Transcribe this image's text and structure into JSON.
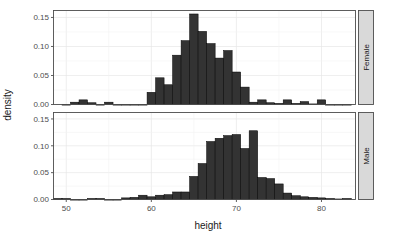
{
  "chart_data": {
    "type": "bar",
    "title": "",
    "subtitle": "",
    "xlabel": "height",
    "ylabel": "density",
    "xlim": [
      48.5,
      84.0
    ],
    "ylim": [
      0.0,
      0.162
    ],
    "grid": true,
    "legend_position": "none",
    "facet_layout": "vertical",
    "facet_strip_position": "right",
    "x_ticks": [
      50,
      60,
      70,
      80
    ],
    "x_tick_labels": [
      "50",
      "60",
      "70",
      "80"
    ],
    "y_ticks": [
      0.0,
      0.05,
      0.1,
      0.15
    ],
    "y_tick_labels": [
      "0.00",
      "0.05",
      "0.10",
      "0.15"
    ],
    "bin_width": 1.0,
    "bar_fill": "#333333",
    "bar_stroke": "#000000",
    "panel_background": "#ffffff",
    "grid_color": "#e6e6e6",
    "strip_background": "#d9d9d9",
    "panels": [
      {
        "label": "Female",
        "bins": [
          {
            "x": 50.0,
            "density": 0.0
          },
          {
            "x": 51.0,
            "density": 0.004
          },
          {
            "x": 52.0,
            "density": 0.008
          },
          {
            "x": 53.0,
            "density": 0.003
          },
          {
            "x": 54.0,
            "density": 0.0
          },
          {
            "x": 55.0,
            "density": 0.004
          },
          {
            "x": 56.0,
            "density": 0.0
          },
          {
            "x": 57.0,
            "density": 0.0
          },
          {
            "x": 58.0,
            "density": 0.0
          },
          {
            "x": 59.0,
            "density": 0.0
          },
          {
            "x": 60.0,
            "density": 0.021
          },
          {
            "x": 61.0,
            "density": 0.046
          },
          {
            "x": 62.0,
            "density": 0.034
          },
          {
            "x": 63.0,
            "density": 0.085
          },
          {
            "x": 64.0,
            "density": 0.11
          },
          {
            "x": 65.0,
            "density": 0.156
          },
          {
            "x": 66.0,
            "density": 0.126
          },
          {
            "x": 67.0,
            "density": 0.105
          },
          {
            "x": 68.0,
            "density": 0.08
          },
          {
            "x": 69.0,
            "density": 0.093
          },
          {
            "x": 70.0,
            "density": 0.056
          },
          {
            "x": 71.0,
            "density": 0.03
          },
          {
            "x": 72.0,
            "density": 0.004
          },
          {
            "x": 73.0,
            "density": 0.008
          },
          {
            "x": 74.0,
            "density": 0.003
          },
          {
            "x": 75.0,
            "density": 0.002
          },
          {
            "x": 76.0,
            "density": 0.008
          },
          {
            "x": 77.0,
            "density": 0.002
          },
          {
            "x": 78.0,
            "density": 0.005
          },
          {
            "x": 79.0,
            "density": 0.001
          },
          {
            "x": 80.0,
            "density": 0.008
          },
          {
            "x": 81.0,
            "density": 0.0
          },
          {
            "x": 82.0,
            "density": 0.0
          },
          {
            "x": 83.0,
            "density": 0.0
          }
        ]
      },
      {
        "label": "Male",
        "bins": [
          {
            "x": 49.0,
            "density": 0.002
          },
          {
            "x": 50.0,
            "density": 0.002
          },
          {
            "x": 51.0,
            "density": 0.0
          },
          {
            "x": 52.0,
            "density": 0.0
          },
          {
            "x": 53.0,
            "density": 0.002
          },
          {
            "x": 54.0,
            "density": 0.002
          },
          {
            "x": 55.0,
            "density": 0.0
          },
          {
            "x": 56.0,
            "density": 0.0
          },
          {
            "x": 57.0,
            "density": 0.003
          },
          {
            "x": 58.0,
            "density": 0.004
          },
          {
            "x": 59.0,
            "density": 0.008
          },
          {
            "x": 60.0,
            "density": 0.005
          },
          {
            "x": 61.0,
            "density": 0.008
          },
          {
            "x": 62.0,
            "density": 0.009
          },
          {
            "x": 63.0,
            "density": 0.014
          },
          {
            "x": 64.0,
            "density": 0.014
          },
          {
            "x": 65.0,
            "density": 0.043
          },
          {
            "x": 66.0,
            "density": 0.067
          },
          {
            "x": 67.0,
            "density": 0.108
          },
          {
            "x": 68.0,
            "density": 0.114
          },
          {
            "x": 69.0,
            "density": 0.119
          },
          {
            "x": 70.0,
            "density": 0.121
          },
          {
            "x": 71.0,
            "density": 0.095
          },
          {
            "x": 72.0,
            "density": 0.128
          },
          {
            "x": 73.0,
            "density": 0.041
          },
          {
            "x": 74.0,
            "density": 0.039
          },
          {
            "x": 75.0,
            "density": 0.029
          },
          {
            "x": 76.0,
            "density": 0.012
          },
          {
            "x": 77.0,
            "density": 0.007
          },
          {
            "x": 78.0,
            "density": 0.005
          },
          {
            "x": 79.0,
            "density": 0.004
          },
          {
            "x": 80.0,
            "density": 0.003
          },
          {
            "x": 81.0,
            "density": 0.002
          },
          {
            "x": 82.0,
            "density": 0.001
          },
          {
            "x": 83.0,
            "density": 0.002
          }
        ]
      }
    ]
  }
}
